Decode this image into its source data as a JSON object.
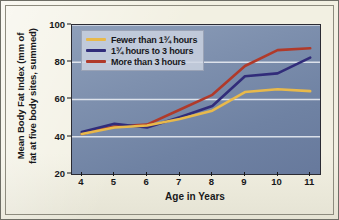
{
  "chart_data": {
    "type": "line",
    "title": "",
    "xlabel": "Age in Years",
    "ylabel": "Mean Body Fat Index (mm of\nfat at five body sites, summed)",
    "ylabel_line1": "Mean Body Fat Index (mm of",
    "ylabel_line2": "fat at five body sites, summed)",
    "x": [
      4,
      5,
      6,
      7,
      8,
      9,
      10,
      11
    ],
    "xlim": [
      3.7,
      11.3
    ],
    "ylim": [
      20,
      100
    ],
    "yticks": [
      20,
      40,
      60,
      80,
      100
    ],
    "xticks": [
      4,
      5,
      6,
      7,
      8,
      9,
      10,
      11
    ],
    "grid": "horizontal",
    "gridlines": [
      40,
      60,
      80,
      100
    ],
    "legend_position": "top-left",
    "series": [
      {
        "name": "Fewer than 1¾ hours",
        "color": "#e8b94b",
        "values": [
          41.5,
          45.0,
          46.0,
          49.5,
          54.0,
          64.0,
          65.5,
          64.5
        ]
      },
      {
        "name": "1¾ hours to 3 hours",
        "color": "#312c7a",
        "values": [
          42.5,
          47.0,
          45.0,
          50.5,
          56.5,
          72.5,
          74.0,
          82.5
        ]
      },
      {
        "name": "More than 3 hours",
        "color": "#b03a2a",
        "values": [
          41.5,
          45.5,
          46.5,
          54.5,
          62.5,
          78.0,
          86.5,
          87.5
        ]
      }
    ]
  },
  "legend": {
    "items": [
      {
        "label": "Fewer than 1¾ hours",
        "color": "#e8b94b"
      },
      {
        "label": "1¾ hours to 3 hours",
        "color": "#312c7a"
      },
      {
        "label": "More than 3 hours",
        "color": "#b03a2a"
      }
    ]
  },
  "axes": {
    "y_title_line1": "Mean Body Fat Index (mm of",
    "y_title_line2": "fat at five body sites, summed)",
    "x_title": "Age in Years",
    "y_ticks": [
      "20",
      "40",
      "60",
      "80",
      "100"
    ],
    "x_ticks": [
      "4",
      "5",
      "6",
      "7",
      "8",
      "9",
      "10",
      "11"
    ]
  },
  "colors": {
    "paper": "#f2f0e2",
    "plot_top": "#8e9fba",
    "plot_bottom": "#67799c",
    "gridline": "#eef1f6",
    "axis": "#18181a",
    "series_yellow": "#e8b94b",
    "series_navy": "#312c7a",
    "series_red": "#b03a2a"
  }
}
